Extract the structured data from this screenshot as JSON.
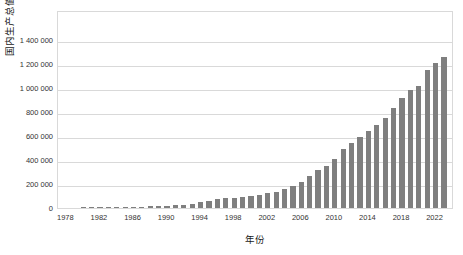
{
  "chart_data": {
    "type": "bar",
    "title": "",
    "xlabel": "年份",
    "ylabel": "国内生产总值 / 亿元",
    "xlim": [
      1977,
      2024
    ],
    "ylim": [
      0,
      1400000
    ],
    "grid": true,
    "legend": false,
    "bar_color": "#7f7f7f",
    "gridline_color": "#d9d9d9",
    "axis_border_color": "#d9d9d9",
    "background_color": "#ffffff",
    "ytick_labels": [
      "1 400 000",
      "1 200 000",
      "1 000 000",
      "800 000",
      "600 000",
      "400 000",
      "200 000",
      "0"
    ],
    "ytick_values": [
      1400000,
      1200000,
      1000000,
      800000,
      600000,
      400000,
      200000,
      0
    ],
    "xtick_labels": [
      "1978",
      "1982",
      "1986",
      "1990",
      "1994",
      "1998",
      "2002",
      "2006",
      "2010",
      "2014",
      "2018",
      "2022"
    ],
    "xtick_values": [
      1978,
      1982,
      1986,
      1990,
      1994,
      1998,
      2002,
      2006,
      2010,
      2014,
      2018,
      2022
    ],
    "categories": [
      1978,
      1979,
      1980,
      1981,
      1982,
      1983,
      1984,
      1985,
      1986,
      1987,
      1988,
      1989,
      1990,
      1991,
      1992,
      1993,
      1994,
      1995,
      1996,
      1997,
      1998,
      1999,
      2000,
      2001,
      2002,
      2003,
      2004,
      2005,
      2006,
      2007,
      2008,
      2009,
      2010,
      2011,
      2012,
      2013,
      2014,
      2015,
      2016,
      2017,
      2018,
      2019,
      2020,
      2021,
      2022,
      2023
    ],
    "values": [
      3679,
      4101,
      4588,
      4936,
      5376,
      6053,
      7246,
      9057,
      10308,
      12102,
      15137,
      17212,
      18873,
      22006,
      27195,
      35674,
      48638,
      61340,
      71814,
      79715,
      85196,
      90564,
      100280,
      110863,
      121717,
      137422,
      161840,
      187319,
      219439,
      270092,
      319245,
      348518,
      412119,
      487940,
      538580,
      592963,
      643563,
      688858,
      746395,
      832036,
      919281,
      986515,
      1013567,
      1149237,
      1210207,
      1260582
    ]
  }
}
